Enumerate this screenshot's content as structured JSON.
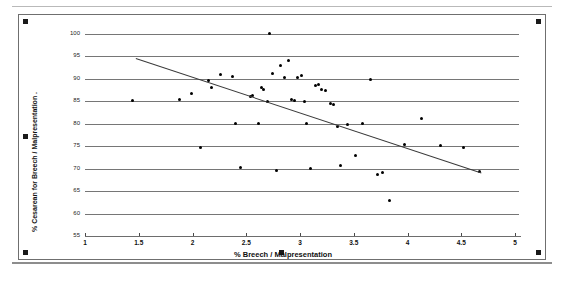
{
  "figure": {
    "frame_label": "embedded-chart-object",
    "selection_handles": 6
  },
  "chart_data": {
    "type": "scatter",
    "title": "",
    "xlabel": "% Breech / Malpresentation",
    "ylabel": "% Cesarean for Breech / Malpresentation .",
    "xlim": [
      1,
      5
    ],
    "ylim": [
      55,
      100
    ],
    "xticks": [
      "1",
      "1.5",
      "2",
      "2.5",
      "3",
      "3.5",
      "4",
      "4.5",
      "5"
    ],
    "xtick_values": [
      1,
      1.5,
      2,
      2.5,
      3,
      3.5,
      4,
      4.5,
      5
    ],
    "yticks": [
      "100",
      "95",
      "90",
      "85",
      "80",
      "75",
      "70",
      "65",
      "60",
      "55"
    ],
    "ytick_values": [
      100,
      95,
      90,
      85,
      80,
      75,
      70,
      65,
      60,
      55
    ],
    "grid": true,
    "grid_axis": "y",
    "legend": "none",
    "marker_color": "#000000",
    "grid_color": "#767676",
    "trendline": {
      "visible": true,
      "color": "#3a3a3a",
      "x_start": 1.47,
      "y_start": 94.6,
      "x_end": 4.68,
      "y_end": 69.1
    },
    "points": [
      {
        "x": 1.44,
        "y": 85.2
      },
      {
        "x": 1.88,
        "y": 85.4
      },
      {
        "x": 1.99,
        "y": 86.7
      },
      {
        "x": 2.07,
        "y": 74.8
      },
      {
        "x": 2.15,
        "y": 89.6
      },
      {
        "x": 2.18,
        "y": 88.1
      },
      {
        "x": 2.26,
        "y": 91.0
      },
      {
        "x": 2.37,
        "y": 90.6
      },
      {
        "x": 2.4,
        "y": 80.1
      },
      {
        "x": 2.45,
        "y": 70.3
      },
      {
        "x": 2.54,
        "y": 86.0
      },
      {
        "x": 2.56,
        "y": 86.4
      },
      {
        "x": 2.61,
        "y": 80.1
      },
      {
        "x": 2.64,
        "y": 88.0
      },
      {
        "x": 2.66,
        "y": 87.6
      },
      {
        "x": 2.7,
        "y": 85.0
      },
      {
        "x": 2.72,
        "y": 100.2
      },
      {
        "x": 2.74,
        "y": 91.2
      },
      {
        "x": 2.78,
        "y": 69.6
      },
      {
        "x": 2.82,
        "y": 93.0
      },
      {
        "x": 2.86,
        "y": 90.3
      },
      {
        "x": 2.89,
        "y": 94.1
      },
      {
        "x": 2.92,
        "y": 85.4
      },
      {
        "x": 2.95,
        "y": 85.1
      },
      {
        "x": 2.98,
        "y": 90.3
      },
      {
        "x": 3.01,
        "y": 90.7
      },
      {
        "x": 3.04,
        "y": 84.9
      },
      {
        "x": 3.06,
        "y": 80.0
      },
      {
        "x": 3.1,
        "y": 70.1
      },
      {
        "x": 3.14,
        "y": 88.5
      },
      {
        "x": 3.17,
        "y": 88.8
      },
      {
        "x": 3.2,
        "y": 87.6
      },
      {
        "x": 3.24,
        "y": 87.5
      },
      {
        "x": 3.28,
        "y": 84.5
      },
      {
        "x": 3.31,
        "y": 84.4
      },
      {
        "x": 3.35,
        "y": 79.3
      },
      {
        "x": 3.38,
        "y": 70.6
      },
      {
        "x": 3.44,
        "y": 79.8
      },
      {
        "x": 3.52,
        "y": 72.9
      },
      {
        "x": 3.58,
        "y": 80.0
      },
      {
        "x": 3.66,
        "y": 89.8
      },
      {
        "x": 3.72,
        "y": 68.6
      },
      {
        "x": 3.77,
        "y": 69.2
      },
      {
        "x": 3.83,
        "y": 63.0
      },
      {
        "x": 3.97,
        "y": 75.4
      },
      {
        "x": 4.13,
        "y": 81.2
      },
      {
        "x": 4.31,
        "y": 75.2
      },
      {
        "x": 4.52,
        "y": 74.8
      },
      {
        "x": 4.67,
        "y": 69.4
      }
    ]
  }
}
